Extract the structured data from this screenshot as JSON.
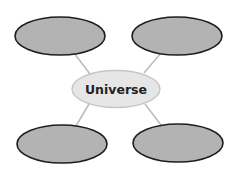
{
  "diagram": {
    "type": "concept-web",
    "center": {
      "label": "Universe"
    },
    "branches": [
      {
        "position": "top-left",
        "label": ""
      },
      {
        "position": "top-right",
        "label": ""
      },
      {
        "position": "bottom-left",
        "label": ""
      },
      {
        "position": "bottom-right",
        "label": ""
      }
    ],
    "colors": {
      "outer_fill": "#b3b3b3",
      "outer_stroke": "#1e1e1e",
      "center_fill": "#e6e6e6",
      "center_stroke": "#c6c6c6",
      "connector": "#bdbdbd",
      "label_text": "#222222"
    }
  }
}
